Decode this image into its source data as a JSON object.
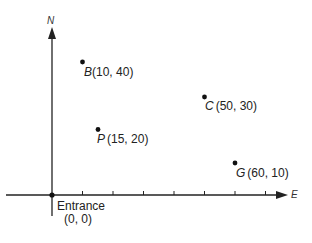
{
  "diagram": {
    "axes": {
      "y_label": "N",
      "x_label": "E",
      "x_ticks_count": 7,
      "origin_px": [
        52,
        195
      ],
      "px_per_unit_x": 3.05,
      "px_per_unit_y": 3.33
    },
    "origin": {
      "name": "Entrance",
      "coords": "(0, 0)"
    },
    "points": [
      {
        "letter": "B",
        "coords": "(10, 40)",
        "x": 10,
        "y": 40
      },
      {
        "letter": "C",
        "coords": "(50, 30)",
        "x": 50,
        "y": 30
      },
      {
        "letter": "P",
        "coords": "(15, 20)",
        "x": 15,
        "y": 20
      },
      {
        "letter": "G",
        "coords": "(60, 10)",
        "x": 60,
        "y": 10
      }
    ],
    "colors": {
      "ink": "#222222",
      "background": "#ffffff"
    }
  }
}
